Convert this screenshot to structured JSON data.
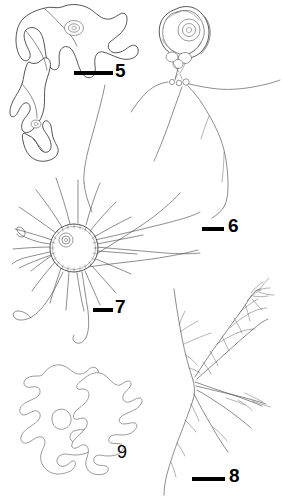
{
  "figure": {
    "type": "scientific-plate",
    "background_color": "#ffffff",
    "ink_color": "#1a1a1a",
    "width_px": 282,
    "height_px": 498,
    "panel_count": 5
  },
  "panels": [
    {
      "id": "panel-5",
      "number": "5",
      "subject": "branching lobose amoeba outline with two nuclei",
      "number_x": 115,
      "number_y": 61,
      "scalebar": {
        "x": 74,
        "y": 71,
        "width": 39
      }
    },
    {
      "id": "panel-6",
      "number": "6",
      "subject": "testate cell body with long trailing filopodia",
      "number_x": 228,
      "number_y": 216,
      "scalebar": {
        "x": 202,
        "y": 227,
        "width": 22
      }
    },
    {
      "id": "panel-7",
      "number": "7",
      "subject": "heliozoan with radiating axopodia and beaded test",
      "number_x": 115,
      "number_y": 297,
      "scalebar": {
        "x": 93,
        "y": 308,
        "width": 20
      }
    },
    {
      "id": "panel-8",
      "number": "8",
      "subject": "branching reticulopodial filament network",
      "number_x": 229,
      "number_y": 466,
      "scalebar": {
        "x": 192,
        "y": 477,
        "width": 33
      }
    },
    {
      "id": "panel-9",
      "number": "9",
      "subject": "reticulate lobed amoeba outline with vacuole",
      "number_x": 117,
      "number_y": 443,
      "scalebar": null
    }
  ]
}
